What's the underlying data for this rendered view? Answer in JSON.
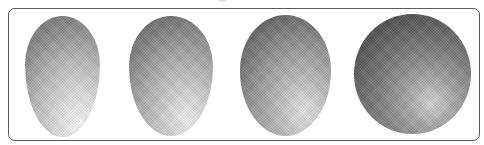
{
  "figure": {
    "frame": {
      "border_color": "#5a5a5a",
      "background": "#ffffff",
      "corner_radius_px": 7
    },
    "shapes": [
      {
        "index": 1,
        "kind": "egg-elongated",
        "darkest": "#7a7a7a",
        "lightest": "#fbfbfb",
        "light_direction": "lower-right highlight"
      },
      {
        "index": 2,
        "kind": "egg",
        "darkest": "#666666",
        "lightest": "#f2f2f2",
        "light_direction": "lower-right highlight"
      },
      {
        "index": 3,
        "kind": "oval",
        "darkest": "#555555",
        "lightest": "#e8e8e8",
        "light_direction": "lower-right highlight"
      },
      {
        "index": 4,
        "kind": "sphere",
        "darkest": "#3a3a3a",
        "lightest": "#d6d6d6",
        "light_direction": "lower-right highlight"
      }
    ]
  }
}
